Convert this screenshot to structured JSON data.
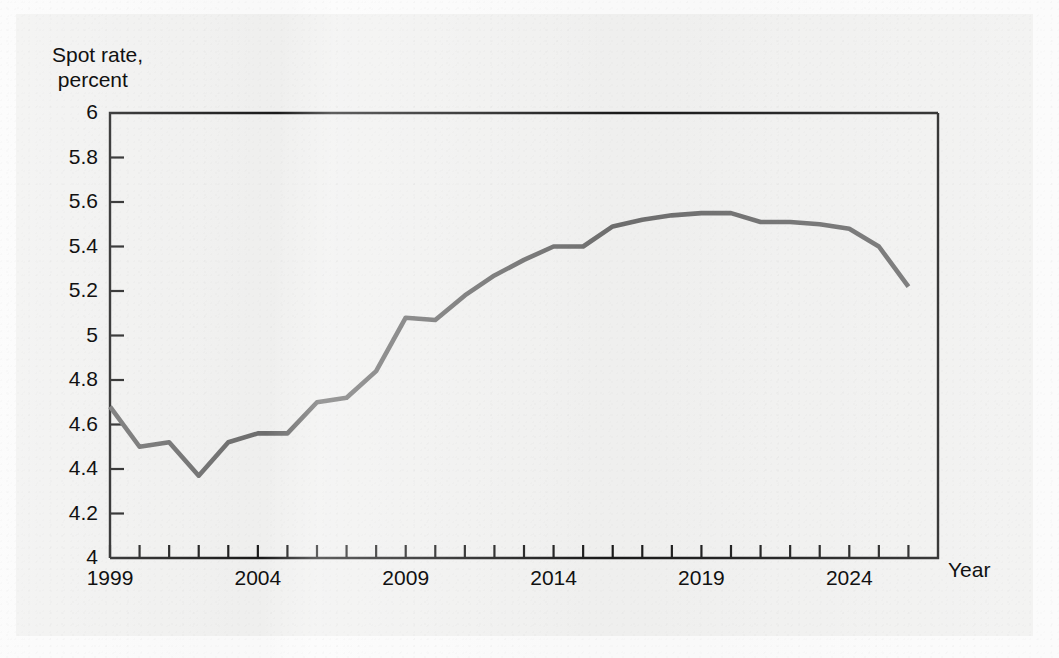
{
  "figure": {
    "background_color": "#f1f1f0",
    "line_color": "#6e6e6e",
    "axis_color": "#1a1a1a",
    "y_axis_title": "Spot rate,\n percent",
    "x_axis_title": "Year"
  },
  "chart_data": {
    "type": "line",
    "title": "",
    "subtitle": "",
    "xlabel": "Year",
    "ylabel": "Spot rate, percent",
    "xlim": [
      1999,
      2027
    ],
    "ylim": [
      4,
      6
    ],
    "grid": false,
    "legend": "none",
    "x_tick_labels": [
      "1999",
      "2004",
      "2009",
      "2014",
      "2019",
      "2024"
    ],
    "x_tick_label_values": [
      1999,
      2004,
      2009,
      2014,
      2019,
      2024
    ],
    "x_minor_tick_interval": 1,
    "y_tick_labels": [
      "4",
      "4.2",
      "4.4",
      "4.6",
      "4.8",
      "5",
      "5.2",
      "5.4",
      "5.6",
      "5.8",
      "6"
    ],
    "y_tick_values": [
      4,
      4.2,
      4.4,
      4.6,
      4.8,
      5,
      5.2,
      5.4,
      5.6,
      5.8,
      6
    ],
    "series": [
      {
        "name": "Spot rate",
        "color": "#6e6e6e",
        "x": [
          1999,
          2000,
          2001,
          2002,
          2003,
          2004,
          2005,
          2006,
          2007,
          2008,
          2009,
          2010,
          2011,
          2012,
          2013,
          2014,
          2015,
          2016,
          2017,
          2018,
          2019,
          2020,
          2021,
          2022,
          2023,
          2024,
          2025,
          2026
        ],
        "values": [
          4.68,
          4.5,
          4.52,
          4.37,
          4.52,
          4.56,
          4.56,
          4.7,
          4.72,
          4.84,
          5.08,
          5.07,
          5.18,
          5.27,
          5.34,
          5.4,
          5.4,
          5.49,
          5.52,
          5.54,
          5.55,
          5.55,
          5.51,
          5.51,
          5.5,
          5.48,
          5.4,
          5.22
        ]
      }
    ]
  }
}
